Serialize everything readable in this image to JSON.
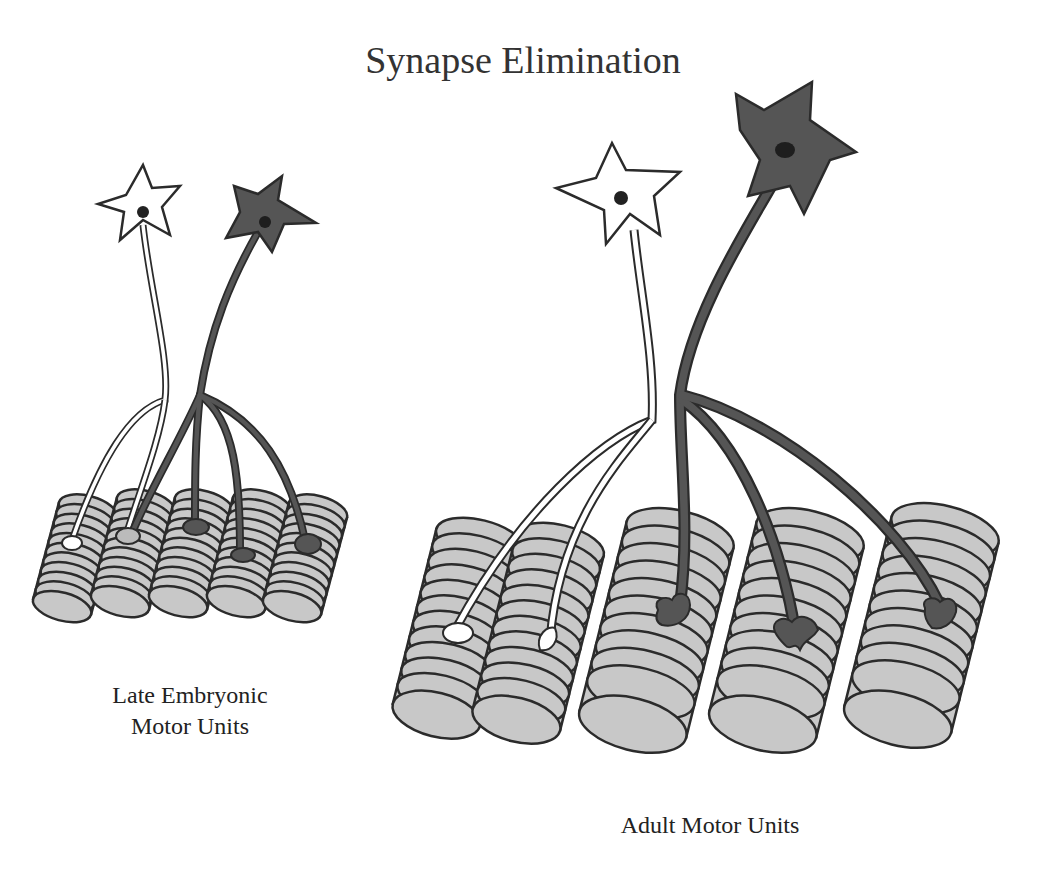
{
  "title": "Synapse Elimination",
  "panels": [
    {
      "id": "late-embryonic",
      "label_line1": "Late Embryonic",
      "label_line2": "Motor Units",
      "neurons": [
        {
          "name": "white-motor-neuron",
          "fill": "#ffffff"
        },
        {
          "name": "dark-motor-neuron",
          "fill": "#555555"
        }
      ],
      "muscle_fibers": 5,
      "innervation": "polyneuronal (each fiber contacted by multiple neurons)"
    },
    {
      "id": "adult",
      "label": "Adult Motor Units",
      "neurons": [
        {
          "name": "white-motor-neuron",
          "fill": "#ffffff"
        },
        {
          "name": "dark-motor-neuron",
          "fill": "#555555"
        }
      ],
      "muscle_fibers": 5,
      "innervation": "mononeuronal (each fiber contacted by one neuron)"
    }
  ],
  "colors": {
    "outline": "#2b2b2b",
    "dark_neuron": "#555555",
    "muscle": "#c8c8c8",
    "white_neuron": "#ffffff"
  }
}
